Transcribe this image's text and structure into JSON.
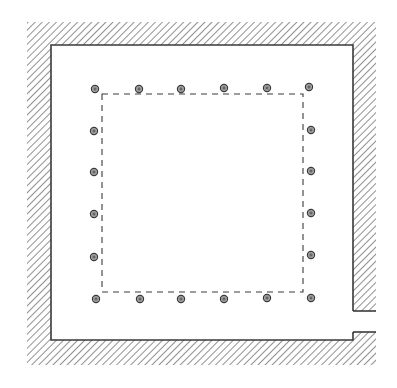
{
  "diagram": {
    "type": "architectural-floor-plan",
    "canvas": {
      "width": 397,
      "height": 388
    },
    "colors": {
      "background": "#ffffff",
      "ink": "#3a3a3a",
      "hatch": "#555555",
      "column_fill": "#9a9a9a",
      "column_center": "#4a4a4a"
    },
    "walls": {
      "outer": {
        "x": 27,
        "y": 22,
        "right": 376,
        "bottom": 365
      },
      "inner": {
        "x": 51,
        "y": 45,
        "right": 353,
        "bottom": 340
      },
      "hatch_pattern": "diagonal-45deg"
    },
    "door_opening": {
      "side": "right",
      "y_top": 311,
      "y_bottom": 332
    },
    "dashed_rectangle": {
      "x": 102,
      "y": 94,
      "right": 303,
      "bottom": 292
    },
    "columns": {
      "radius": 3.6,
      "top": [
        [
          95,
          89
        ],
        [
          139,
          89
        ],
        [
          181,
          89
        ],
        [
          224,
          88
        ],
        [
          267,
          88
        ],
        [
          309,
          87
        ]
      ],
      "bottom": [
        [
          96,
          299
        ],
        [
          140,
          299
        ],
        [
          181,
          299
        ],
        [
          224,
          299
        ],
        [
          267,
          298
        ],
        [
          311,
          298
        ]
      ],
      "left": [
        [
          94,
          131
        ],
        [
          94,
          172
        ],
        [
          94,
          214
        ],
        [
          94,
          257
        ]
      ],
      "right": [
        [
          311,
          130
        ],
        [
          311,
          171
        ],
        [
          311,
          213
        ],
        [
          311,
          255
        ]
      ]
    },
    "column_count": 20
  }
}
